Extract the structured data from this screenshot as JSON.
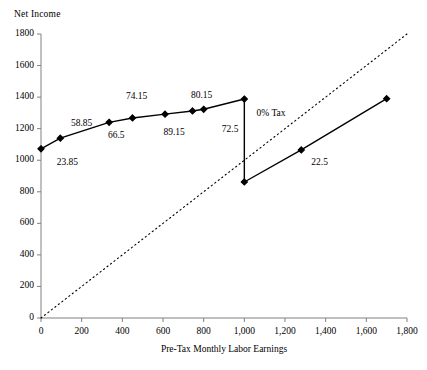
{
  "chart_data": {
    "type": "line",
    "title": "",
    "ylabel": "Net Income",
    "xlabel": "Pre-Tax Monthly Labor Earnings",
    "xlim": [
      0,
      1800
    ],
    "ylim": [
      0,
      1800
    ],
    "grid": false,
    "legend": "none",
    "xticks": [
      "0",
      "200",
      "400",
      "600",
      "800",
      "1,000",
      "1,200",
      "1,400",
      "1,600",
      "1,800"
    ],
    "xtick_values": [
      0,
      200,
      400,
      600,
      800,
      1000,
      1200,
      1400,
      1600,
      1800
    ],
    "yticks": [
      "0",
      "200",
      "400",
      "600",
      "800",
      "1000",
      "1200",
      "1400",
      "1600",
      "1800"
    ],
    "ytick_values": [
      0,
      200,
      400,
      600,
      800,
      1000,
      1200,
      1400,
      1600,
      1800
    ],
    "series": [
      {
        "name": "Budget constraint",
        "style": "solid-with-markers",
        "points": [
          {
            "x": 0,
            "y": 1072
          },
          {
            "x": 95,
            "y": 1140
          },
          {
            "x": 335,
            "y": 1240
          },
          {
            "x": 450,
            "y": 1268
          },
          {
            "x": 610,
            "y": 1292
          },
          {
            "x": 745,
            "y": 1312
          },
          {
            "x": 800,
            "y": 1323
          },
          {
            "x": 1000,
            "y": 1388
          }
        ]
      },
      {
        "name": "Vertical drop at 1000",
        "style": "solid-no-markers",
        "points": [
          {
            "x": 1000,
            "y": 1388
          },
          {
            "x": 1000,
            "y": 862
          }
        ]
      },
      {
        "name": "Post-notch segment",
        "style": "solid-with-markers",
        "points": [
          {
            "x": 1000,
            "y": 862
          },
          {
            "x": 1280,
            "y": 1065
          },
          {
            "x": 1700,
            "y": 1390
          }
        ]
      },
      {
        "name": "45-degree reference line",
        "style": "dotted",
        "points": [
          {
            "x": 0,
            "y": 0
          },
          {
            "x": 1800,
            "y": 1800
          }
        ]
      }
    ],
    "point_labels": [
      {
        "text": "23.85",
        "x": 130,
        "y": 985,
        "anchor": "middle"
      },
      {
        "text": "58.85",
        "x": 200,
        "y": 1232,
        "anchor": "middle"
      },
      {
        "text": "66.5",
        "x": 370,
        "y": 1152,
        "anchor": "middle"
      },
      {
        "text": "74.15",
        "x": 470,
        "y": 1400,
        "anchor": "middle"
      },
      {
        "text": "89.15",
        "x": 655,
        "y": 1172,
        "anchor": "middle"
      },
      {
        "text": "80.15",
        "x": 790,
        "y": 1408,
        "anchor": "middle"
      },
      {
        "text": "72.5",
        "x": 930,
        "y": 1192,
        "anchor": "middle"
      },
      {
        "text": "22.5",
        "x": 1370,
        "y": 980,
        "anchor": "middle"
      }
    ],
    "annotations": [
      {
        "text": "0% Tax",
        "x": 1060,
        "y": 1290,
        "anchor": "start"
      }
    ]
  }
}
